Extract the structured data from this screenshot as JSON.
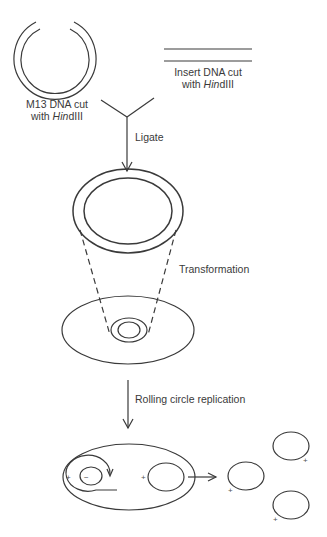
{
  "diagram": {
    "labels": {
      "m13": {
        "line1": "M13 DNA cut",
        "line2_prefix": "with ",
        "line2_italic": "Hin",
        "line2_suffix": "dIII"
      },
      "insert": {
        "line1": "Insert DNA cut",
        "line2_prefix": "with ",
        "line2_italic": "Hin",
        "line2_suffix": "dIII"
      },
      "ligate": "Ligate",
      "transformation": "Transformation",
      "rolling": "Rolling circle replication"
    },
    "signs": {
      "plus": "+",
      "minus": "−"
    },
    "colors": {
      "stroke": "#3a3a3a",
      "background": "#ffffff"
    }
  }
}
